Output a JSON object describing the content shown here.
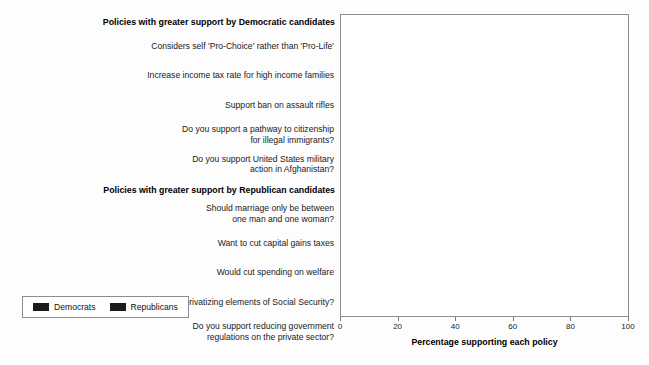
{
  "chart_data": {
    "type": "bar",
    "orientation": "horizontal",
    "title": "",
    "xlabel": "Percentage supporting each policy",
    "ylabel": "",
    "xlim": [
      0,
      100
    ],
    "xticks": [
      "0",
      "20",
      "40",
      "60",
      "80",
      "100"
    ],
    "grid": false,
    "legend_position": "lower left",
    "series": [
      {
        "name": "Democrats",
        "color": "#1b1b1b"
      },
      {
        "name": "Republicans",
        "color": "#1b1b1b"
      }
    ],
    "groups": [
      {
        "title": "Policies with greater support by Democratic candidates",
        "items": [
          {
            "label_lines": [
              "Considers self 'Pro-Choice' rather than 'Pro-Life'"
            ],
            "democrats": 74,
            "republicans": 9
          },
          {
            "label_lines": [
              "Increase income tax rate for high income families"
            ],
            "democrats": 56,
            "republicans": 5
          },
          {
            "label_lines": [
              "Support ban on assault rifles"
            ],
            "democrats": 72,
            "republicans": 12
          },
          {
            "label_lines": [
              "Do you support a pathway to citizenship",
              "for illegal immigrants?"
            ],
            "democrats": 86,
            "republicans": 25
          },
          {
            "label_lines": [
              "Do you support United States military",
              "action in Afghanistan?"
            ],
            "democrats": 82,
            "republicans": 54
          }
        ]
      },
      {
        "title": "Policies with greater support by Republican candidates",
        "items": [
          {
            "label_lines": [
              "Should marriage only be between",
              "one man and one woman?"
            ],
            "democrats": 31,
            "republicans": 94
          },
          {
            "label_lines": [
              "Want to cut capital gains taxes"
            ],
            "democrats": 14,
            "republicans": 85
          },
          {
            "label_lines": [
              "Would cut spending on welfare"
            ],
            "democrats": 29,
            "republicans": 72
          },
          {
            "label_lines": [
              "Do you support privatizing elements of Social Security?"
            ],
            "democrats": 4,
            "republicans": 78
          },
          {
            "label_lines": [
              "Do you support reducing government",
              "regulations on the private sector?"
            ],
            "democrats": 37,
            "republicans": 96
          }
        ]
      }
    ]
  },
  "legend": {
    "items": [
      {
        "label": "Democrats"
      },
      {
        "label": "Republicans"
      }
    ]
  },
  "axis": {
    "xtitle": "Percentage supporting each policy"
  }
}
